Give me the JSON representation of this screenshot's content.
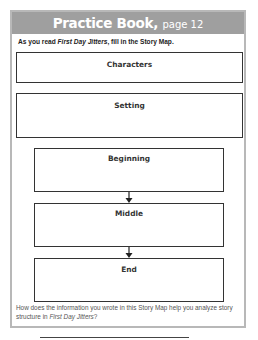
{
  "header": {
    "title": "Practice Book,",
    "page_label": "page 12"
  },
  "instruction": {
    "prefix": "As you read ",
    "book_title": "First Day Jitters",
    "suffix": ", fill in the Story Map."
  },
  "story_map": {
    "boxes": [
      {
        "label": "Characters"
      },
      {
        "label": "Setting"
      },
      {
        "label": "Beginning"
      },
      {
        "label": "Middle"
      },
      {
        "label": "End"
      }
    ],
    "arrow_icon": "down-arrow-icon"
  },
  "question": {
    "prefix": "How does the information you wrote in this Story Map help you analyze story structure in ",
    "book_title": "First Day Jitters",
    "suffix": "?"
  },
  "colors": {
    "header_bg": "#9f9f9f",
    "frame_border": "#b8b8b8",
    "box_border": "#333333"
  }
}
